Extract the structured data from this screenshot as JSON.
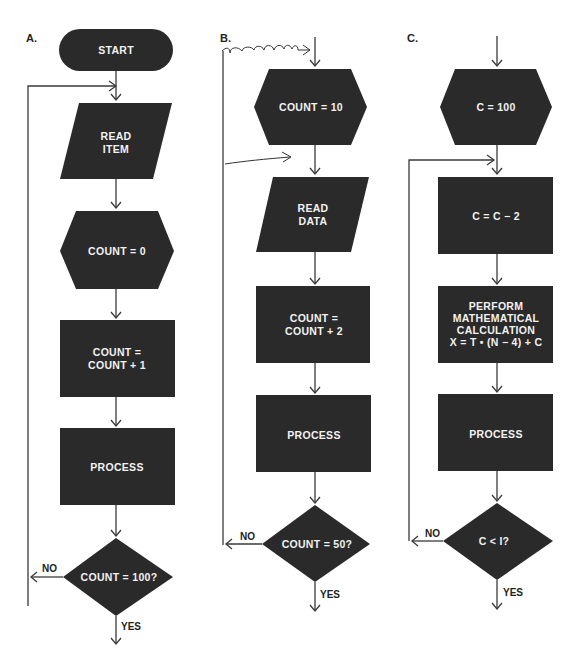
{
  "figure": {
    "panels": [
      {
        "id": "A",
        "label": "A.",
        "steps": [
          {
            "shape": "terminal",
            "text": [
              "START"
            ]
          },
          {
            "shape": "input-output",
            "text": [
              "READ",
              "ITEM"
            ]
          },
          {
            "shape": "preparation",
            "text": [
              "COUNT = 0"
            ]
          },
          {
            "shape": "process",
            "text": [
              "COUNT =",
              "COUNT + 1"
            ]
          },
          {
            "shape": "process",
            "text": [
              "PROCESS"
            ]
          },
          {
            "shape": "decision",
            "text": [
              "COUNT = 100?"
            ]
          }
        ],
        "branches": {
          "no": "NO",
          "yes": "YES"
        }
      },
      {
        "id": "B",
        "label": "B.",
        "steps": [
          {
            "shape": "preparation",
            "text": [
              "COUNT = 10"
            ]
          },
          {
            "shape": "input-output",
            "text": [
              "READ",
              "DATA"
            ]
          },
          {
            "shape": "process",
            "text": [
              "COUNT =",
              "COUNT + 2"
            ]
          },
          {
            "shape": "process",
            "text": [
              "PROCESS"
            ]
          },
          {
            "shape": "decision",
            "text": [
              "COUNT = 50?"
            ]
          }
        ],
        "branches": {
          "no": "NO",
          "yes": "YES"
        }
      },
      {
        "id": "C",
        "label": "C.",
        "steps": [
          {
            "shape": "preparation",
            "text": [
              "C = 100"
            ]
          },
          {
            "shape": "process",
            "text": [
              "C = C − 2"
            ]
          },
          {
            "shape": "process",
            "text": [
              "PERFORM",
              "MATHEMATICAL",
              "CALCULATION",
              "X = T • (N − 4) + C"
            ]
          },
          {
            "shape": "process",
            "text": [
              "PROCESS"
            ]
          },
          {
            "shape": "decision",
            "text": [
              "C < I?"
            ]
          }
        ],
        "branches": {
          "no": "NO",
          "yes": "YES"
        }
      }
    ],
    "colors": {
      "shape_fill": "#2a2a2a",
      "text": "#f2f2f2",
      "lines": "#3a3a3a",
      "background": "#ffffff"
    }
  }
}
